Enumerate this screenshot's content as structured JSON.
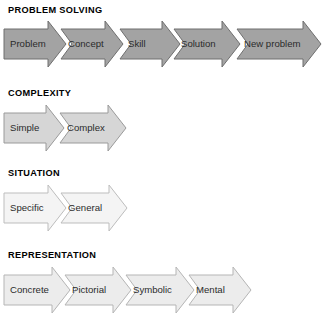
{
  "page": {
    "background_color": "#ffffff",
    "width": 324,
    "height": 324
  },
  "chart_data": {
    "type": "diagram",
    "subtype": "process-arrow-chevron-chains",
    "title": "",
    "rows": [
      {
        "heading": "PROBLEM SOLVING",
        "fill": "#a3a3a3",
        "stroke": "#6f6f6f",
        "steps": [
          "Problem",
          "Concept",
          "Skill",
          "Solution",
          "New problem"
        ]
      },
      {
        "heading": "COMPLEXITY",
        "fill": "#d6d6d6",
        "stroke": "#9a9a9a",
        "steps": [
          "Simple",
          "Complex"
        ]
      },
      {
        "heading": "SITUATION",
        "fill": "#f4f4f4",
        "stroke": "#bdbdbd",
        "steps": [
          "Specific",
          "General"
        ]
      },
      {
        "heading": "REPRESENTATION",
        "fill": "#ececec",
        "stroke": "#b5b5b5",
        "steps": [
          "Concrete",
          "Pictorial",
          "Symbolic",
          "Mental"
        ]
      }
    ]
  },
  "sections": {
    "problem_solving": {
      "heading": "PROBLEM SOLVING",
      "fill": "#a3a3a3",
      "stroke": "#6f6f6f",
      "steps": [
        {
          "label": "Problem",
          "x": 4,
          "w": 62,
          "label_x": 10,
          "label_y": 18
        },
        {
          "label": "Concept",
          "x": 61,
          "w": 62,
          "label_x": 68,
          "label_y": 18
        },
        {
          "label": "Skill",
          "x": 120,
          "w": 60,
          "label_x": 128,
          "label_y": 18
        },
        {
          "label": "Solution",
          "x": 174,
          "w": 66,
          "label_x": 181,
          "label_y": 18
        },
        {
          "label": "New problem",
          "x": 237,
          "w": 84,
          "label_x": 244,
          "label_y": 18
        }
      ]
    },
    "complexity": {
      "heading": "COMPLEXITY",
      "fill": "#d6d6d6",
      "stroke": "#9a9a9a",
      "steps": [
        {
          "label": "Simple",
          "x": 4,
          "w": 60,
          "label_x": 10,
          "label_y": 18
        },
        {
          "label": "Complex",
          "x": 60,
          "w": 66,
          "label_x": 67,
          "label_y": 18
        }
      ]
    },
    "situation": {
      "heading": "SITUATION",
      "fill": "#f4f4f4",
      "stroke": "#bdbdbd",
      "steps": [
        {
          "label": "Specific",
          "x": 4,
          "w": 62,
          "label_x": 10,
          "label_y": 18
        },
        {
          "label": "General",
          "x": 61,
          "w": 66,
          "label_x": 68,
          "label_y": 18
        }
      ]
    },
    "representation": {
      "heading": "REPRESENTATION",
      "fill": "#ececec",
      "stroke": "#b5b5b5",
      "steps": [
        {
          "label": "Concrete",
          "x": 4,
          "w": 66,
          "label_x": 10,
          "label_y": 18
        },
        {
          "label": "Pictorial",
          "x": 65,
          "w": 66,
          "label_x": 72,
          "label_y": 18
        },
        {
          "label": "Symbolic",
          "x": 126,
          "w": 68,
          "label_x": 133,
          "label_y": 18
        },
        {
          "label": "Mental",
          "x": 189,
          "w": 62,
          "label_x": 196,
          "label_y": 18
        }
      ]
    }
  }
}
